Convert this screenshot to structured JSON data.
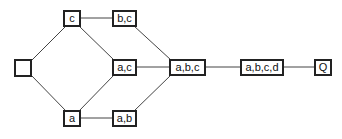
{
  "diagram": {
    "type": "lattice",
    "nodes": [
      {
        "id": "empty",
        "label": "",
        "x": 14,
        "y": 59,
        "w": 18
      },
      {
        "id": "c",
        "label": "c",
        "x": 63,
        "y": 10,
        "w": 18
      },
      {
        "id": "bc",
        "label": "b,c",
        "x": 112,
        "y": 10,
        "w": 25
      },
      {
        "id": "ac",
        "label": "a,c",
        "x": 112,
        "y": 59,
        "w": 25
      },
      {
        "id": "a",
        "label": "a",
        "x": 63,
        "y": 110,
        "w": 18
      },
      {
        "id": "ab",
        "label": "a,b",
        "x": 112,
        "y": 110,
        "w": 25
      },
      {
        "id": "abc",
        "label": "a,b,c",
        "x": 169,
        "y": 59,
        "w": 37
      },
      {
        "id": "abcd",
        "label": "a,b,c,d",
        "x": 240,
        "y": 59,
        "w": 44
      },
      {
        "id": "Q",
        "label": "Q",
        "x": 314,
        "y": 59,
        "w": 18
      }
    ],
    "edges": [
      [
        "empty",
        "c"
      ],
      [
        "empty",
        "a"
      ],
      [
        "c",
        "bc"
      ],
      [
        "c",
        "ac"
      ],
      [
        "a",
        "ac"
      ],
      [
        "a",
        "ab"
      ],
      [
        "bc",
        "abc"
      ],
      [
        "ac",
        "abc"
      ],
      [
        "ab",
        "abc"
      ],
      [
        "abc",
        "abcd"
      ],
      [
        "abcd",
        "Q"
      ]
    ]
  }
}
